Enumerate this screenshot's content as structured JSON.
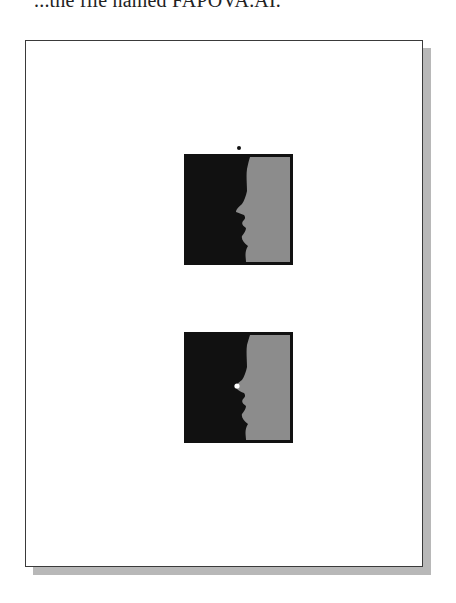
{
  "caption": {
    "text": "...the file named FAPOVA.AI."
  },
  "page": {
    "background": "#ffffff",
    "border_color": "#3a3a3a",
    "shadow_color": "#b8b8b8"
  },
  "artwork": [
    {
      "name": "profile-silhouette-top",
      "silhouette_color": "#111111",
      "background_color": "#8c8c8c",
      "border_color": "#111111",
      "marker": {
        "type": "anchor-point-above",
        "color": "#111111"
      }
    },
    {
      "name": "profile-silhouette-bottom",
      "silhouette_color": "#111111",
      "background_color": "#8c8c8c",
      "border_color": "#111111",
      "marker": {
        "type": "selected-anchor-point-at-nose",
        "color": "#ffffff"
      }
    }
  ]
}
